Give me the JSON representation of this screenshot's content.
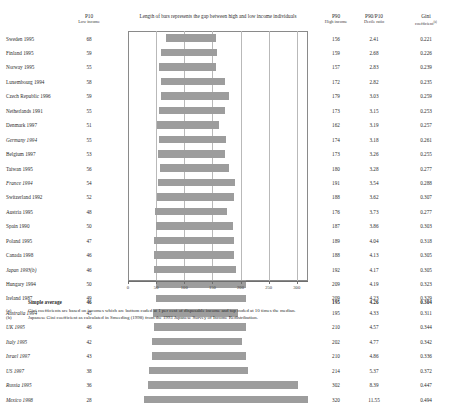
{
  "header": {
    "p10_label": "P10",
    "p10_sub": "Low income",
    "chart_title": "Length of bars represents the gap between high and low income individuals",
    "p90_label": "P90",
    "p90_sub": "High income",
    "ratio_label": "P90/P10",
    "ratio_sub": "Decile ratio",
    "gini_label": "Gini",
    "gini_sub": "coefficient",
    "gini_sup": "(a)"
  },
  "average": {
    "label": "Simple average",
    "p10": "46",
    "p90": "195",
    "ratio": "4.26",
    "gini": "0.304"
  },
  "footnotes": [
    {
      "marker": "(a)",
      "text": "Gini coefficients are based on incomes which are bottom coded at 1 per cent of disposable income and top coded at 10 times the median."
    },
    {
      "marker": "(b)",
      "text": "Japanese Gini coefficient as calculated in Smeeding (1998) from the 1993 Japanese Survey of Income Redistribution."
    }
  ],
  "chart_data": {
    "type": "bar",
    "orientation": "horizontal",
    "title": "Length of bars represents the gap between high and low income individuals",
    "xlabel": "",
    "ylabel": "",
    "xlim": [
      0,
      320
    ],
    "xticks": [
      0,
      50,
      100,
      150,
      200,
      250,
      300
    ],
    "grid": true,
    "legend": null,
    "note": "Each bar spans from the P10 (low income) value to the P90 (high income) value.",
    "categories": [
      "Sweden 1995",
      "Finland 1995",
      "Norway 1995",
      "Luxembourg 1994",
      "Czech Republic 1996",
      "Netherlands 1991",
      "Denmark 1997",
      "Germany 1994",
      "Belgium 1997",
      "Taiwan 1995",
      "France 1994",
      "Switzerland 1992",
      "Austria 1995",
      "Spain 1990",
      "Poland 1995",
      "Canada 1998",
      "Japan 1993",
      "Hungary 1994",
      "Ireland 1987",
      "Australia 1994",
      "UK 1995",
      "Italy 1995",
      "Israel 1997",
      "US 1997",
      "Russia 1995",
      "Mexico 1998"
    ],
    "series": [
      {
        "name": "P10 (low income)",
        "values": [
          68,
          59,
          55,
          58,
          59,
          55,
          51,
          55,
          53,
          56,
          54,
          52,
          55,
          50,
          47,
          46,
          46,
          46,
          45,
          45,
          46,
          44,
          42,
          38,
          36,
          28
        ]
      },
      {
        "name": "P90 (high income)",
        "values": [
          156,
          159,
          157,
          172,
          179,
          173,
          162,
          174,
          173,
          180,
          191,
          180,
          176,
          187,
          189,
          190,
          192,
          209,
          209,
          195,
          210,
          202,
          210,
          214,
          302,
          320
        ]
      },
      {
        "name": "P90/P10 decile ratio",
        "values": [
          2.41,
          2.68,
          2.83,
          2.82,
          3.03,
          3.15,
          3.19,
          3.18,
          3.26,
          3.28,
          3.54,
          3.62,
          3.73,
          3.86,
          4.04,
          4.13,
          4.17,
          4.19,
          4.23,
          4.33,
          4.57,
          4.77,
          4.86,
          5.37,
          8.39,
          11.55
        ]
      },
      {
        "name": "Gini coefficient",
        "values": [
          0.221,
          0.226,
          0.239,
          0.235,
          0.259,
          0.253,
          0.257,
          0.261,
          0.255,
          0.277,
          0.288,
          0.307,
          0.277,
          0.303,
          0.318,
          0.305,
          0.305,
          0.323,
          0.329,
          0.311,
          0.344,
          0.342,
          0.336,
          0.372,
          0.447,
          0.494
        ]
      }
    ]
  },
  "rows": [
    {
      "name": "Sweden 1995",
      "italic": false,
      "p10": "68",
      "p90": "156",
      "ratio": "2.41",
      "gini": "0.221",
      "bar_start": 68,
      "bar_end": 156
    },
    {
      "name": "Finland 1995",
      "italic": false,
      "p10": "59",
      "p90": "159",
      "ratio": "2.68",
      "gini": "0.226",
      "bar_start": 59,
      "bar_end": 159
    },
    {
      "name": "Norway 1995",
      "italic": false,
      "p10": "55",
      "p90": "157",
      "ratio": "2.83",
      "gini": "0.239",
      "bar_start": 55,
      "bar_end": 157
    },
    {
      "name": "Luxembourg 1994",
      "italic": false,
      "p10": "58",
      "p90": "172",
      "ratio": "2.82",
      "gini": "0.235",
      "bar_start": 58,
      "bar_end": 172
    },
    {
      "name": "Czech Republic 1996",
      "italic": false,
      "p10": "59",
      "p90": "179",
      "ratio": "3.03",
      "gini": "0.259",
      "bar_start": 59,
      "bar_end": 179
    },
    {
      "name": "Netherlands 1991",
      "italic": false,
      "p10": "55",
      "p90": "173",
      "ratio": "3.15",
      "gini": "0.253",
      "bar_start": 55,
      "bar_end": 173
    },
    {
      "name": "Denmark 1997",
      "italic": false,
      "p10": "51",
      "p90": "162",
      "ratio": "3.19",
      "gini": "0.257",
      "bar_start": 51,
      "bar_end": 162
    },
    {
      "name": "Germany 1994",
      "italic": true,
      "p10": "55",
      "p90": "174",
      "ratio": "3.18",
      "gini": "0.261",
      "bar_start": 55,
      "bar_end": 174
    },
    {
      "name": "Belgium 1997",
      "italic": false,
      "p10": "53",
      "p90": "173",
      "ratio": "3.26",
      "gini": "0.255",
      "bar_start": 53,
      "bar_end": 173
    },
    {
      "name": "Taiwan 1995",
      "italic": false,
      "p10": "56",
      "p90": "180",
      "ratio": "3.28",
      "gini": "0.277",
      "bar_start": 56,
      "bar_end": 180
    },
    {
      "name": "France 1994",
      "italic": true,
      "p10": "54",
      "p90": "191",
      "ratio": "3.54",
      "gini": "0.288",
      "bar_start": 54,
      "bar_end": 191
    },
    {
      "name": "Switzerland 1992",
      "italic": false,
      "p10": "52",
      "p90": "188",
      "ratio": "3.62",
      "gini": "0.307",
      "bar_start": 52,
      "bar_end": 188
    },
    {
      "name": "Austria 1995",
      "italic": false,
      "p10": "48",
      "p90": "176",
      "ratio": "3.73",
      "gini": "0.277",
      "bar_start": 48,
      "bar_end": 176
    },
    {
      "name": "Spain 1990",
      "italic": false,
      "p10": "50",
      "p90": "187",
      "ratio": "3.86",
      "gini": "0.303",
      "bar_start": 50,
      "bar_end": 187
    },
    {
      "name": "Poland 1995",
      "italic": false,
      "p10": "47",
      "p90": "189",
      "ratio": "4.04",
      "gini": "0.318",
      "bar_start": 47,
      "bar_end": 189
    },
    {
      "name": "Canada 1998",
      "italic": false,
      "p10": "46",
      "p90": "188",
      "ratio": "4.13",
      "gini": "0.305",
      "bar_start": 46,
      "bar_end": 188
    },
    {
      "name": "Japan 1993(b)",
      "italic": true,
      "p10": "46",
      "p90": "192",
      "ratio": "4.17",
      "gini": "0.305",
      "bar_start": 46,
      "bar_end": 192
    },
    {
      "name": "Hungary 1994",
      "italic": false,
      "p10": "50",
      "p90": "209",
      "ratio": "4.19",
      "gini": "0.323",
      "bar_start": 50,
      "bar_end": 209
    },
    {
      "name": "Ireland 1987",
      "italic": false,
      "p10": "49",
      "p90": "209",
      "ratio": "4.23",
      "gini": "0.329",
      "bar_start": 49,
      "bar_end": 209
    },
    {
      "name": "Australia 1994",
      "italic": true,
      "p10": "45",
      "p90": "195",
      "ratio": "4.33",
      "gini": "0.311",
      "bar_start": 45,
      "bar_end": 195
    },
    {
      "name": "UK 1995",
      "italic": true,
      "p10": "46",
      "p90": "210",
      "ratio": "4.57",
      "gini": "0.344",
      "bar_start": 46,
      "bar_end": 210
    },
    {
      "name": "Italy 1995",
      "italic": true,
      "p10": "42",
      "p90": "202",
      "ratio": "4.77",
      "gini": "0.342",
      "bar_start": 42,
      "bar_end": 202
    },
    {
      "name": "Israel 1997",
      "italic": true,
      "p10": "43",
      "p90": "210",
      "ratio": "4.86",
      "gini": "0.336",
      "bar_start": 43,
      "bar_end": 210
    },
    {
      "name": "US 1997",
      "italic": true,
      "p10": "38",
      "p90": "214",
      "ratio": "5.37",
      "gini": "0.372",
      "bar_start": 38,
      "bar_end": 214
    },
    {
      "name": "Russia 1995",
      "italic": true,
      "p10": "36",
      "p90": "302",
      "ratio": "8.39",
      "gini": "0.447",
      "bar_start": 36,
      "bar_end": 302
    },
    {
      "name": "Mexico 1998",
      "italic": true,
      "p10": "28",
      "p90": "320",
      "ratio": "11.55",
      "gini": "0.494",
      "bar_start": 28,
      "bar_end": 320
    }
  ]
}
